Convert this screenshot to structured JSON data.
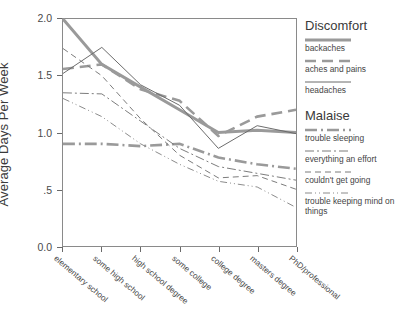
{
  "chart_data": {
    "type": "line",
    "title": "",
    "xlabel": "",
    "ylabel": "Average Days Per Week",
    "ylim": [
      0.0,
      2.0
    ],
    "yticks": [
      "0.0",
      ".5",
      "1.0",
      "1.5",
      "2.0"
    ],
    "ytick_values": [
      0.0,
      0.5,
      1.0,
      1.5,
      2.0
    ],
    "grid": false,
    "legend_position": "right",
    "categories": [
      "elementary school",
      "some high school",
      "high school degree",
      "some college",
      "college degree",
      "masters degree",
      "PhD/professional"
    ],
    "legend_groups": [
      {
        "heading": "Discomfort",
        "series": [
          "backaches",
          "aches and pains",
          "headaches"
        ]
      },
      {
        "heading": "Malaise",
        "series": [
          "trouble sleeping",
          "everything an effort",
          "couldn't get going",
          "trouble keeping mind on things"
        ]
      }
    ],
    "series": [
      {
        "name": "backaches",
        "group": "Discomfort",
        "style": "solid-thick",
        "color": "#9a9a9a",
        "width": 3,
        "dash": "",
        "values": [
          2.0,
          1.6,
          1.4,
          1.2,
          1.0,
          1.02,
          1.0
        ]
      },
      {
        "name": "aches and pains",
        "group": "Discomfort",
        "style": "long-dash",
        "color": "#9a9a9a",
        "width": 2.6,
        "dash": "11,6",
        "values": [
          1.56,
          1.6,
          1.38,
          1.28,
          0.97,
          1.14,
          1.2
        ]
      },
      {
        "name": "headaches",
        "group": "Discomfort",
        "style": "solid-thin",
        "color": "#6a6a6a",
        "width": 1,
        "dash": "",
        "values": [
          1.52,
          1.75,
          1.42,
          1.24,
          0.86,
          1.06,
          0.99
        ]
      },
      {
        "name": "trouble sleeping",
        "group": "Malaise",
        "style": "dash-dot-thick",
        "color": "#9a9a9a",
        "width": 2.6,
        "dash": "12,4,2,4",
        "values": [
          0.9,
          0.9,
          0.88,
          0.9,
          0.78,
          0.72,
          0.68
        ]
      },
      {
        "name": "everything an effort",
        "group": "Malaise",
        "style": "dash-dot",
        "color": "#7a7a7a",
        "width": 1,
        "dash": "9,3,2,3",
        "values": [
          1.35,
          1.34,
          1.1,
          0.86,
          0.7,
          0.64,
          0.58
        ]
      },
      {
        "name": "couldn't get going",
        "group": "Malaise",
        "style": "dashed",
        "color": "#7a7a7a",
        "width": 1,
        "dash": "6,4",
        "values": [
          1.74,
          1.5,
          1.12,
          0.8,
          0.6,
          0.62,
          0.5
        ]
      },
      {
        "name": "trouble keeping mind on things",
        "group": "Malaise",
        "style": "dash-dot-dot",
        "color": "#8a8a8a",
        "width": 1,
        "dash": "7,3,1,3,1,3",
        "values": [
          1.3,
          1.14,
          0.9,
          0.72,
          0.57,
          0.52,
          0.34
        ]
      }
    ]
  }
}
